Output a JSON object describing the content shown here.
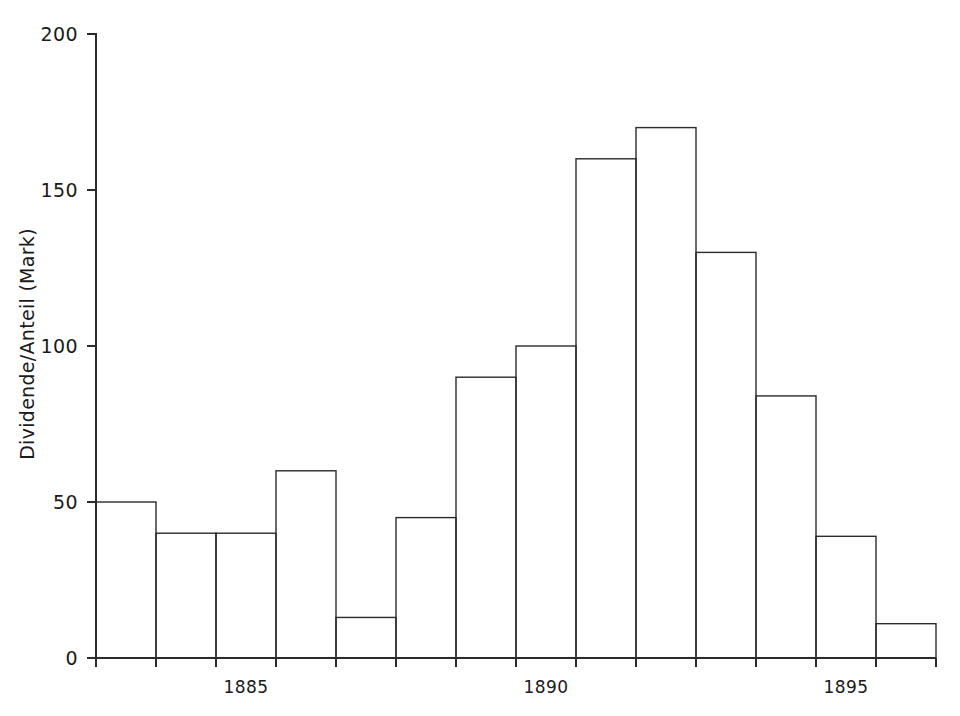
{
  "chart_data": {
    "type": "bar",
    "title": "",
    "subtitle": "",
    "xlabel": "",
    "ylabel": "Dividende/Anteil (Mark)",
    "ylim": [
      0,
      200
    ],
    "xlim": [
      1882.5,
      1896.5
    ],
    "grid": false,
    "legend": null,
    "yticks": [
      0,
      50,
      100,
      150,
      200
    ],
    "ytick_labels": [
      "0",
      "50",
      "100",
      "150",
      "200"
    ],
    "xticks": [
      1885,
      1890,
      1895
    ],
    "xtick_labels": [
      "1885",
      "1890",
      "1895"
    ],
    "bar_style": "outlined-unfilled-contiguous",
    "categories": [
      "1883",
      "1884",
      "1885",
      "1886",
      "1887",
      "1888",
      "1889",
      "1890",
      "1891",
      "1892",
      "1893",
      "1894",
      "1895",
      "1896"
    ],
    "values": [
      50,
      40,
      40,
      60,
      13,
      45,
      90,
      100,
      160,
      170,
      130,
      84,
      39,
      11
    ],
    "annotations": []
  },
  "axes": {
    "y_axis_title": "Dividende/Anteil (Mark)",
    "y_tick_labels": [
      "0",
      "50",
      "100",
      "150",
      "200"
    ],
    "x_tick_labels": [
      "1885",
      "1890",
      "1895"
    ]
  },
  "colors": {
    "background": "#ffffff",
    "ink": "#2a2a2a",
    "bar_stroke": "#2b2b2b",
    "text": "#1a1a1a"
  }
}
